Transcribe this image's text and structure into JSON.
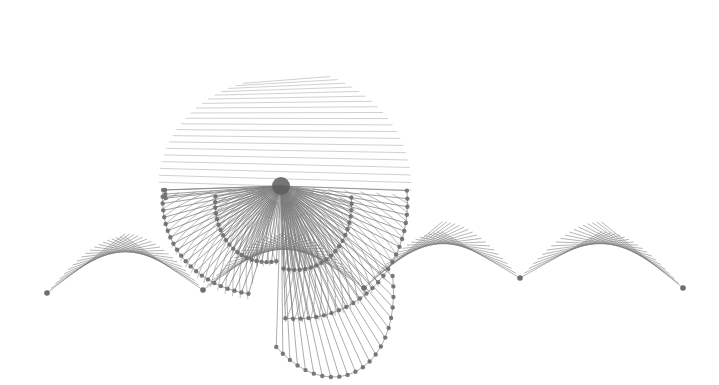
{
  "canvas": {
    "width": 719,
    "height": 385,
    "background_color": "#ffffff"
  },
  "figure": {
    "title": "String art envelope figure",
    "kind": "epicycloid-chord-diagram",
    "line_color": "#7a7a7a",
    "line_width": 0.9,
    "node_color": "#6e6e6e",
    "node_radius": 2.2
  },
  "chart_data": {
    "type": "scatter",
    "title": "String art envelope figure",
    "xlabel": "",
    "ylabel": "",
    "grid": false,
    "legend": false,
    "xlim": [
      0,
      719
    ],
    "ylim": [
      0,
      385
    ],
    "construction": {
      "model": "modular-multiplication-chords",
      "circle_center": [
        281,
        186
      ],
      "circle_radius": 108,
      "points_on_circle": 56,
      "multiplier": 3,
      "secondary_multiplier": 5,
      "rotation_deg": -98,
      "shear_x": 0.0,
      "scale_x": 2.05,
      "scale_y": 1.35,
      "families": [
        {
          "name": "outer-fan-left",
          "multiplier": 3,
          "count": 28,
          "rotation_deg": 186,
          "scale_x": 2.05,
          "scale_y": 1.2,
          "center": [
            281,
            186
          ],
          "radius": 112
        },
        {
          "name": "outer-fan-right",
          "multiplier": 3,
          "count": 28,
          "rotation_deg": 6,
          "scale_x": 2.05,
          "scale_y": 1.45,
          "center": [
            281,
            186
          ],
          "radius": 112
        },
        {
          "name": "inner-web",
          "multiplier": 5,
          "count": 34,
          "rotation_deg": 0,
          "scale_x": 1.0,
          "scale_y": 0.72,
          "center": [
            281,
            186
          ],
          "radius": 92
        }
      ]
    },
    "key_features": {
      "hub_node": [
        281,
        186
      ],
      "cusp_nodes": [
        [
          47,
          293
        ],
        [
          203,
          290
        ],
        [
          364,
          288
        ],
        [
          520,
          278
        ],
        [
          683,
          288
        ]
      ],
      "extent_top": 33,
      "extent_bottom": 362,
      "extent_left": 46,
      "extent_right": 686
    }
  }
}
